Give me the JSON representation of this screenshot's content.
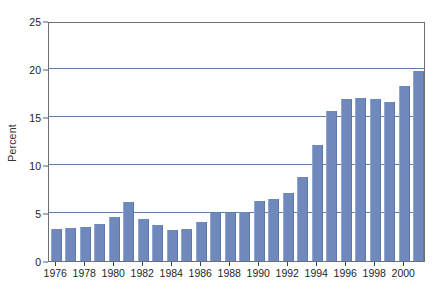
{
  "chart_data": {
    "type": "bar",
    "title": "",
    "subtitle": "",
    "xlabel": "",
    "ylabel": "Percent",
    "ylim": [
      0,
      25
    ],
    "ytick_values": [
      0,
      5,
      10,
      15,
      20,
      25
    ],
    "ytick_labels": [
      "0",
      "5",
      "10",
      "15",
      "20",
      "25"
    ],
    "grid": "horizontal",
    "gridline_values": [
      5,
      10,
      15,
      20
    ],
    "legend": null,
    "legend_position": "none",
    "bar_color": "#7089bd",
    "gridline_color": "#5c80a8",
    "frame_color": "#6b7078",
    "categories": [
      "1976",
      "1977",
      "1978",
      "1979",
      "1980",
      "1981",
      "1982",
      "1983",
      "1984",
      "1985",
      "1986",
      "1987",
      "1988",
      "1989",
      "1990",
      "1991",
      "1992",
      "1993",
      "1994",
      "1995",
      "1996",
      "1997",
      "1998",
      "1999",
      "2000",
      "2001"
    ],
    "values": [
      3.3,
      3.4,
      3.5,
      3.9,
      4.6,
      6.1,
      4.4,
      3.7,
      3.2,
      3.3,
      4.1,
      5.0,
      5.0,
      5.1,
      6.2,
      6.5,
      7.1,
      8.8,
      12.1,
      15.6,
      16.9,
      17.0,
      16.9,
      16.6,
      18.2,
      19.8
    ],
    "xtick_labels": [
      "1976",
      "1978",
      "1980",
      "1982",
      "1984",
      "1986",
      "1988",
      "1990",
      "1992",
      "1994",
      "1996",
      "1998",
      "2000"
    ],
    "xtick_categories": [
      "1976",
      "1978",
      "1980",
      "1982",
      "1984",
      "1986",
      "1988",
      "1990",
      "1992",
      "1994",
      "1996",
      "1998",
      "2000"
    ]
  }
}
